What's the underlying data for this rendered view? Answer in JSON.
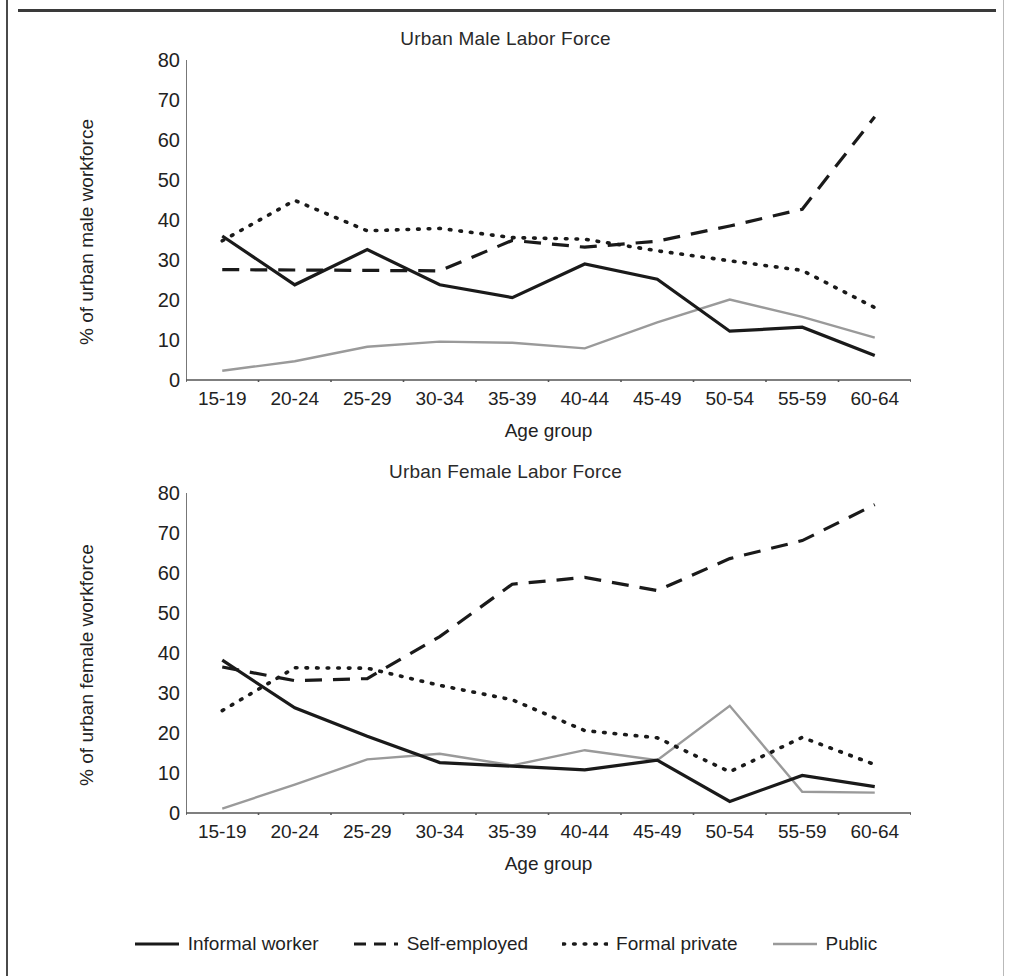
{
  "colors": {
    "informal": "#1a1a1a",
    "self_employed": "#1a1a1a",
    "formal_private": "#1a1a1a",
    "public": "#9a9a9a",
    "axis": "#555555",
    "text": "#222222"
  },
  "axis": {
    "y_ticks": [
      "0",
      "10",
      "20",
      "30",
      "40",
      "50",
      "60",
      "70",
      "80"
    ],
    "y_min": 0,
    "y_max": 80,
    "x_title": "Age group"
  },
  "legend": {
    "items": [
      {
        "label": "Informal worker",
        "style": "solid",
        "color": "#1a1a1a"
      },
      {
        "label": "Self-employed",
        "style": "dashed",
        "color": "#1a1a1a"
      },
      {
        "label": "Formal private",
        "style": "dotted",
        "color": "#1a1a1a"
      },
      {
        "label": "Public",
        "style": "solid",
        "color": "#9a9a9a"
      }
    ]
  },
  "chart_data": [
    {
      "type": "line",
      "id": "male",
      "title": "Urban Male Labor Force",
      "xlabel": "Age group",
      "ylabel": "% of urban male workforce",
      "categories": [
        "15-19",
        "20-24",
        "25-29",
        "30-34",
        "35-39",
        "40-44",
        "45-49",
        "50-54",
        "55-59",
        "60-64"
      ],
      "ylim": [
        0,
        80
      ],
      "ytick_step": 10,
      "grid": false,
      "legend_position": "bottom",
      "series": [
        {
          "name": "Informal worker",
          "style": "solid",
          "color": "#1a1a1a",
          "values": [
            36,
            23.8,
            32.6,
            23.8,
            20.6,
            29,
            25.2,
            12.2,
            13.2,
            6.1
          ]
        },
        {
          "name": "Self-employed",
          "style": "dashed",
          "color": "#1a1a1a",
          "values": [
            27.6,
            27.5,
            27.4,
            27.3,
            34.9,
            33.2,
            34.7,
            38.5,
            42.7,
            65.8
          ]
        },
        {
          "name": "Formal private",
          "style": "dotted",
          "color": "#1a1a1a",
          "values": [
            34.8,
            44.9,
            37.3,
            37.9,
            35.6,
            35.2,
            32.3,
            29.8,
            27.4,
            18.1
          ]
        },
        {
          "name": "Public",
          "style": "solid",
          "color": "#9a9a9a",
          "values": [
            2.3,
            4.7,
            8.3,
            9.6,
            9.3,
            7.9,
            14.4,
            20.1,
            15.8,
            10.6
          ]
        }
      ]
    },
    {
      "type": "line",
      "id": "female",
      "title": "Urban Female Labor Force",
      "xlabel": "Age group",
      "ylabel": "% of urban female workforce",
      "categories": [
        "15-19",
        "20-24",
        "25-29",
        "30-34",
        "35-39",
        "40-44",
        "45-49",
        "50-54",
        "55-59",
        "60-64"
      ],
      "ylim": [
        0,
        80
      ],
      "ytick_step": 10,
      "grid": false,
      "legend_position": "bottom",
      "series": [
        {
          "name": "Informal worker",
          "style": "solid",
          "color": "#1a1a1a",
          "values": [
            38.2,
            26.3,
            19.2,
            12.6,
            11.7,
            10.8,
            13.2,
            2.9,
            9.4,
            6.6
          ]
        },
        {
          "name": "Self-employed",
          "style": "dashed",
          "color": "#1a1a1a",
          "values": [
            36.5,
            33.1,
            33.6,
            44.1,
            57.2,
            58.9,
            55.6,
            63.6,
            68.1,
            77.1
          ]
        },
        {
          "name": "Formal private",
          "style": "dotted",
          "color": "#1a1a1a",
          "values": [
            25.6,
            36.3,
            36.2,
            31.9,
            28.3,
            20.6,
            18.8,
            10.3,
            18.9,
            12.1
          ]
        },
        {
          "name": "Public",
          "style": "solid",
          "color": "#9a9a9a",
          "values": [
            1.1,
            7.1,
            13.4,
            14.8,
            11.9,
            15.7,
            13.2,
            26.8,
            5.3,
            5.1
          ]
        }
      ]
    }
  ]
}
